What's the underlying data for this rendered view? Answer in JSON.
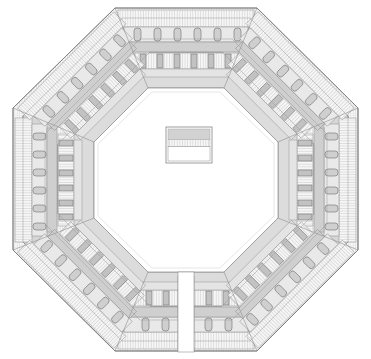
{
  "drawing": {
    "title": "Octagonal Fortress Floor Plan",
    "type": "architectural-floor-plan",
    "description": "Symmetric octagonal building plan with eight radial wings, continuous double-wall ring, colonnade of piers along each wing, central open courtyard and a small rectangular structure at the centre. A gap at the centre of the south wing marks the entrance.",
    "background_color": "#ffffff",
    "line_color": "#7a7a7a",
    "wall_fill": "#d8d8d8",
    "light_fill": "#ececec",
    "hatch_color": "#b4b4b4",
    "column_fill": "#cfcfcf"
  },
  "geometry": {
    "canvas_width": 371,
    "canvas_height": 359,
    "center_x": 186,
    "center_y": 180,
    "outer_radius": 178,
    "mid_radius": 150,
    "inner_radius": 120,
    "court_radius": 92,
    "rotation_deg": 22.5,
    "sides": 8,
    "outer_vertices": [
      {
        "label": "N-W",
        "x": 115,
        "y": 8
      },
      {
        "label": "N-E",
        "x": 257,
        "y": 8
      },
      {
        "label": "E-N",
        "x": 358,
        "y": 108
      },
      {
        "label": "E-S",
        "x": 358,
        "y": 250
      },
      {
        "label": "S-E",
        "x": 257,
        "y": 351
      },
      {
        "label": "S-W",
        "x": 115,
        "y": 351
      },
      {
        "label": "W-S",
        "x": 13,
        "y": 250
      },
      {
        "label": "W-N",
        "x": 13,
        "y": 108
      }
    ],
    "court_vertices": [
      {
        "label": "N-W",
        "x": 148,
        "y": 88
      },
      {
        "label": "N-E",
        "x": 224,
        "y": 88
      },
      {
        "label": "E-N",
        "x": 278,
        "y": 142
      },
      {
        "label": "E-S",
        "x": 278,
        "y": 218
      },
      {
        "label": "S-E",
        "x": 224,
        "y": 272
      },
      {
        "label": "S-W",
        "x": 148,
        "y": 272
      },
      {
        "label": "W-S",
        "x": 94,
        "y": 218
      },
      {
        "label": "W-N",
        "x": 94,
        "y": 142
      }
    ]
  },
  "wings": [
    {
      "id": "wing-north",
      "name": "north-wing",
      "angle_deg": 270,
      "piers": 6,
      "openings": 6,
      "has_entrance_gap": false
    },
    {
      "id": "wing-northeast",
      "name": "northeast-wing",
      "angle_deg": 315,
      "piers": 6,
      "openings": 6,
      "has_entrance_gap": false
    },
    {
      "id": "wing-east",
      "name": "east-wing",
      "angle_deg": 0,
      "piers": 6,
      "openings": 6,
      "has_entrance_gap": false
    },
    {
      "id": "wing-southeast",
      "name": "southeast-wing",
      "angle_deg": 45,
      "piers": 6,
      "openings": 6,
      "has_entrance_gap": false
    },
    {
      "id": "wing-south",
      "name": "south-wing",
      "angle_deg": 90,
      "piers": 4,
      "openings": 4,
      "has_entrance_gap": true
    },
    {
      "id": "wing-southwest",
      "name": "southwest-wing",
      "angle_deg": 135,
      "piers": 6,
      "openings": 6,
      "has_entrance_gap": false
    },
    {
      "id": "wing-west",
      "name": "west-wing",
      "angle_deg": 180,
      "piers": 6,
      "openings": 6,
      "has_entrance_gap": false
    },
    {
      "id": "wing-northwest",
      "name": "northwest-wing",
      "angle_deg": 225,
      "piers": 6,
      "openings": 6,
      "has_entrance_gap": false
    }
  ],
  "central_structure": {
    "name": "central-pavilion",
    "x": 166,
    "y": 127,
    "width": 46,
    "height": 36,
    "bands": [
      {
        "label": "roof-band",
        "fill": "#d2d2d2",
        "height_ratio": 0.33
      },
      {
        "label": "hatch-band",
        "fill": "#f2f2f2",
        "height_ratio": 0.22
      },
      {
        "label": "open-band",
        "fill": "#ffffff",
        "height_ratio": 0.45
      }
    ]
  },
  "entrance": {
    "name": "south-entrance-gap",
    "x": 178,
    "y": 300,
    "width": 16,
    "height": 52
  },
  "legend": {
    "scale_note": "",
    "north_note": ""
  }
}
